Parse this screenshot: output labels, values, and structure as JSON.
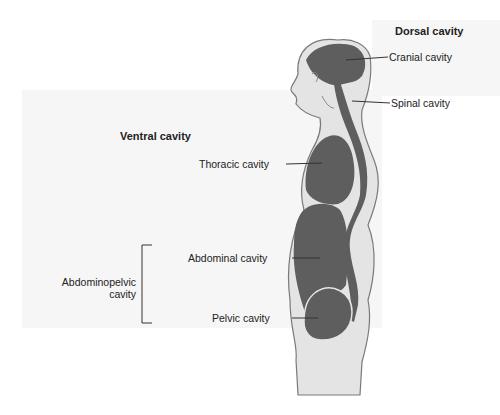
{
  "diagram": {
    "groups": {
      "dorsal": {
        "title": "Dorsal cavity"
      },
      "ventral": {
        "title": "Ventral cavity"
      }
    },
    "labels": {
      "cranial": "Cranial cavity",
      "spinal": "Spinal cavity",
      "thoracic": "Thoracic cavity",
      "abdominal": "Abdominal cavity",
      "pelvic": "Pelvic cavity",
      "abdominopelvic_line1": "Abdominopelvic",
      "abdominopelvic_line2": "cavity"
    },
    "colors": {
      "body_fill": "#e4e4e4",
      "body_outline": "#7a7a7a",
      "cavity_fill": "#5e5e5e",
      "panel_bg": "#f6f6f6",
      "leader_line": "#333333"
    }
  }
}
